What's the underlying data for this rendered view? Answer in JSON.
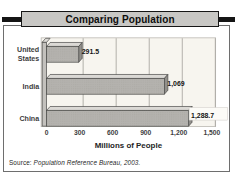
{
  "title_bar": {
    "text": "Comparing Population"
  },
  "chart_data": {
    "type": "bar",
    "orientation": "horizontal",
    "style": "3d-gray",
    "title": "Comparing Population",
    "categories": [
      "United States",
      "India",
      "China"
    ],
    "values": [
      291.5,
      1069,
      1288.7
    ],
    "value_labels": [
      "291.5",
      "1,069",
      "1,288.7"
    ],
    "xlabel": "Millions of People",
    "ylabel": "",
    "xlim": [
      0,
      1500
    ],
    "x_ticks": [
      0,
      300,
      600,
      900,
      1200,
      1500
    ],
    "x_tick_labels": [
      "0",
      "300",
      "600",
      "900",
      "1,200",
      "1,500"
    ],
    "grid": true,
    "legend": false
  },
  "source_note": {
    "prefix": "Source: ",
    "citation": "Population Reference Bureau, 2003."
  },
  "colors": {
    "title_plate_bg": "#c8c7c4",
    "title_plate_border": "#161616",
    "accent_rule": "#151515",
    "outer_border": "#6e6e6e",
    "plot_bg": "#f7f5ef",
    "plot_border": "#b9b7b1",
    "gridline": "#a9a7a1",
    "bar_front": "#b4b2ae",
    "bar_top": "#dbd9d5",
    "bar_side": "#92908c",
    "bar_outline": "#4a4a48",
    "wall_front": "#c3c1bd",
    "wall_top": "#dedcd8",
    "value_label_box_bg": "#fcfbf7",
    "value_label_box_border": "#ccc9c4",
    "text_dark": "#141414",
    "text_label": "#3d3d3d"
  }
}
